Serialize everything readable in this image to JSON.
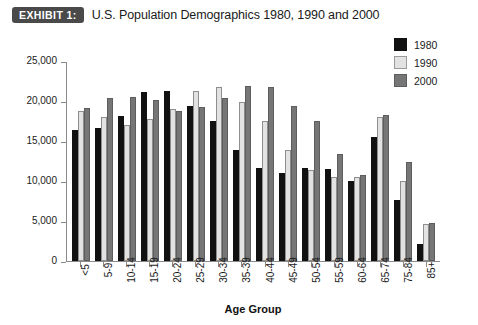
{
  "header": {
    "badge": "EXHIBIT 1:",
    "title": "U.S. Population Demographics 1980, 1990 and 2000"
  },
  "legend": {
    "position": "top-right",
    "entries": [
      {
        "label": "1980",
        "color": "#111111",
        "key": "s1980"
      },
      {
        "label": "1990",
        "color": "#e2e2e2",
        "key": "s1990"
      },
      {
        "label": "2000",
        "color": "#767676",
        "key": "s2000"
      }
    ]
  },
  "axes": {
    "y_ticks": [
      "25,000",
      "20,000",
      "15,000",
      "10,000",
      "5,000",
      "0"
    ],
    "x_title": "Age Group"
  },
  "chart_data": {
    "type": "bar",
    "title": "U.S. Population Demographics 1980, 1990 and 2000",
    "xlabel": "Age Group",
    "ylabel": "",
    "ylim": [
      0,
      25000
    ],
    "ytick_values": [
      0,
      5000,
      10000,
      15000,
      20000,
      25000
    ],
    "ytick_labels": [
      "0",
      "5,000",
      "10,000",
      "15,000",
      "20,000",
      "25,000"
    ],
    "grid": false,
    "legend_position": "top-right",
    "categories": [
      "<5",
      "5-9",
      "10-14",
      "15-19",
      "20-24",
      "25-29",
      "30-34",
      "35-39",
      "40-44",
      "45-49",
      "50-54",
      "55-59",
      "60-64",
      "65-74",
      "75-84",
      "85+"
    ],
    "series": [
      {
        "name": "1980",
        "color": "#111111",
        "values": [
          16400,
          16700,
          18200,
          21200,
          21300,
          19500,
          17600,
          14000,
          11700,
          11100,
          11700,
          11600,
          10100,
          15600,
          7700,
          2200
        ]
      },
      {
        "name": "1990",
        "color": "#e2e2e2",
        "values": [
          18900,
          18100,
          17100,
          17800,
          19100,
          21300,
          21900,
          20000,
          17600,
          13900,
          11400,
          10500,
          10600,
          18100,
          10100,
          4600
        ]
      },
      {
        "name": "2000",
        "color": "#767676",
        "values": [
          19200,
          20500,
          20600,
          20200,
          18900,
          19400,
          20500,
          22000,
          21900,
          19500,
          17600,
          13500,
          10800,
          18400,
          12400,
          4800
        ]
      }
    ]
  }
}
